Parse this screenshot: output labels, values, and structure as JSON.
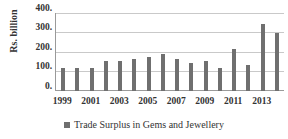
{
  "chart_data": {
    "type": "bar",
    "title": "",
    "xlabel": "",
    "ylabel": "Rs. billion",
    "ylim": [
      0,
      400
    ],
    "ytick_labels": [
      "400.",
      "300.",
      "200.",
      "100.",
      "0."
    ],
    "ytick_values": [
      400,
      300,
      200,
      100,
      0
    ],
    "grid": true,
    "legend_position": "bottom",
    "categories": [
      "1999",
      "2000",
      "2001",
      "2002",
      "2003",
      "2004",
      "2005",
      "2006",
      "2007",
      "2008",
      "2009",
      "2010",
      "2011",
      "2012",
      "2013",
      "2014"
    ],
    "xtick_labels": [
      "1999",
      "2001",
      "2003",
      "2005",
      "2007",
      "2009",
      "2011",
      "2013"
    ],
    "series": [
      {
        "name": "Trade Surplus in Gems and Jewellery",
        "color": "#6f6f6f",
        "values": [
          118,
          118,
          119,
          152,
          155,
          163,
          175,
          190,
          164,
          144,
          154,
          116,
          218,
          131,
          345,
          300
        ]
      }
    ]
  },
  "legend": {
    "entries": [
      {
        "label": "Trade Surplus in Gems and Jewellery",
        "marker": "square-marker-icon",
        "color": "#6f6f6f"
      }
    ]
  }
}
